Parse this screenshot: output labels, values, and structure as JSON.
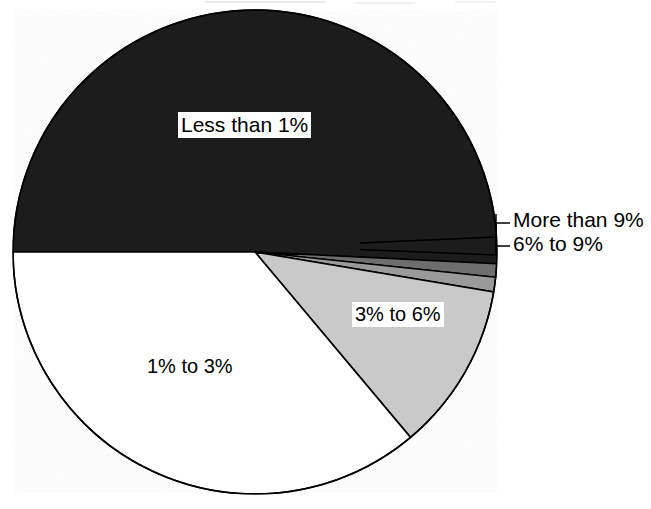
{
  "chart_data": {
    "type": "pie",
    "title": "",
    "xlabel": "",
    "ylabel": "",
    "legend_position": "none",
    "grid": false,
    "center": {
      "x": 255,
      "y": 252
    },
    "radius": 242,
    "start_angle_deg": 270,
    "direction": "clockwise",
    "categories": [
      "Less than 1%",
      "More than 9%",
      "6% to 9%",
      "3% to 6%",
      "1% to 3%"
    ],
    "values": [
      50.0,
      0.9,
      1.0,
      11.2,
      36.9
    ],
    "slices": [
      {
        "label": "Less than 1%",
        "value": 50.0,
        "start_deg": 270,
        "end_deg": 452.8,
        "fill": "#1a1a1a",
        "label_style": "boxed-inside"
      },
      {
        "label": "More than 9%",
        "value": 0.9,
        "start_deg": 452.8,
        "end_deg": 456.0,
        "fill": "#6e6e6e",
        "label_style": "leader-right"
      },
      {
        "label": "6% to 9%",
        "value": 1.0,
        "start_deg": 456.0,
        "end_deg": 459.5,
        "fill": "#9a9a9a",
        "label_style": "leader-right"
      },
      {
        "label": "3% to 6%",
        "value": 11.2,
        "start_deg": 459.5,
        "end_deg": 500.0,
        "fill": "#c9c9c9",
        "label_style": "boxed-inside"
      },
      {
        "label": "1% to 3%",
        "value": 36.9,
        "start_deg": 500.0,
        "end_deg": 630.0,
        "fill": "#ffffff",
        "label_style": "plain-inside"
      }
    ],
    "colors": {
      "less_than_1": "#1a1a1a",
      "more_than_9": "#6e6e6e",
      "six_to_nine": "#9a9a9a",
      "three_to_six": "#c9c9c9",
      "one_to_three": "#ffffff",
      "outline": "#000000",
      "background": "#ffffff",
      "text": "#000000"
    }
  },
  "labels": {
    "less_than_1": "Less than 1%",
    "more_than_9": "More than 9%",
    "six_to_nine": "6% to 9%",
    "three_to_six": "3% to 6%",
    "one_to_three": "1% to 3%"
  }
}
